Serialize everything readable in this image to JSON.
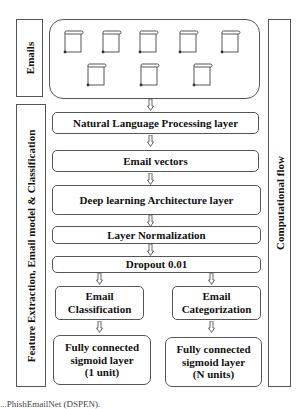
{
  "diagram": {
    "side_labels": {
      "emails": "Emails",
      "feature": "Feature Extraction, Email model & Classification",
      "flow": "Computational flow"
    },
    "emails_group": {
      "icon": "email-scroll-icon",
      "count": 8
    },
    "layers": {
      "nlp": "Natural Language Processing layer",
      "vectors": "Email vectors",
      "deep": "Deep learning Architecture layer",
      "norm": "Layer Normalization",
      "dropout": "Dropout 0.01"
    },
    "branches": {
      "left": {
        "title_line1": "Email",
        "title_line2": "Classification",
        "fc_line1": "Fully connected",
        "fc_line2": "sigmoid layer",
        "fc_line3": "(1 unit)"
      },
      "right": {
        "title_line1": "Email",
        "title_line2": "Categorization",
        "fc_line1": "Fully connected",
        "fc_line2": "sigmoid layer",
        "fc_line3": "(N units)"
      }
    },
    "caption": "...PhishEmailNet (DSPEN)."
  }
}
